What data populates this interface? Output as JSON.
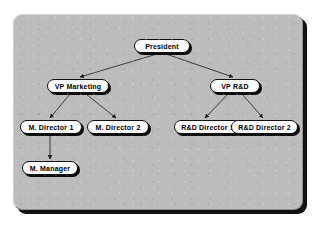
{
  "diagram": {
    "panel": {
      "background_color": "#bcbcbc",
      "shadow_color": "#111111"
    },
    "node_style": {
      "fill_color": "#fdfdfd",
      "border_color": "#101010",
      "shadow_color": "#0a0a0a",
      "text_color": "#000000"
    },
    "connector_style": {
      "line_color": "#2b2b2b",
      "arrow_color": "#1a1a1a"
    },
    "nodes": [
      {
        "id": "president",
        "label": "President",
        "level": 0,
        "x": 120,
        "y": 24,
        "w": 56
      },
      {
        "id": "vp-marketing",
        "label": "VP Marketing",
        "level": 1,
        "x": 33,
        "y": 64,
        "w": 62
      },
      {
        "id": "vp-rnd",
        "label": "VP R&D",
        "level": 1,
        "x": 196,
        "y": 64,
        "w": 50
      },
      {
        "id": "m-director-1",
        "label": "M. Director 1",
        "level": 2,
        "x": 6,
        "y": 105,
        "w": 62
      },
      {
        "id": "m-director-2",
        "label": "M. Director 2",
        "level": 2,
        "x": 73,
        "y": 105,
        "w": 62
      },
      {
        "id": "rnd-director-1",
        "label": "R&D Director 1",
        "level": 2,
        "x": 160,
        "y": 105,
        "w": 67
      },
      {
        "id": "rnd-director-2",
        "label": "R&D Director 2",
        "level": 2,
        "x": 217,
        "y": 105,
        "w": 67
      },
      {
        "id": "m-manager",
        "label": "M. Manager",
        "level": 3,
        "x": 8,
        "y": 146,
        "w": 56
      }
    ],
    "edges": [
      {
        "from": "president",
        "to": "vp-marketing"
      },
      {
        "from": "president",
        "to": "vp-rnd"
      },
      {
        "from": "vp-marketing",
        "to": "m-director-1"
      },
      {
        "from": "vp-marketing",
        "to": "m-director-2"
      },
      {
        "from": "vp-rnd",
        "to": "rnd-director-1"
      },
      {
        "from": "vp-rnd",
        "to": "rnd-director-2"
      },
      {
        "from": "m-director-1",
        "to": "m-manager"
      }
    ]
  }
}
